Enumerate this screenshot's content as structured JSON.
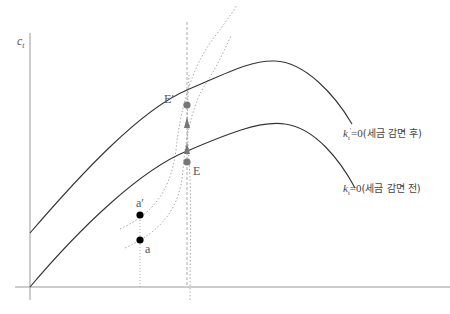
{
  "diagram": {
    "type": "phase-diagram",
    "axes": {
      "y_label": "c",
      "y_label_sub": "t"
    },
    "curves": [
      {
        "id": "kdot-after",
        "label_var": "k",
        "label_sub": "t",
        "label_prime": "'",
        "label_eq": "=0",
        "label_text": "(세금 감면 후)"
      },
      {
        "id": "kdot-before",
        "label_var": "k",
        "label_sub": "t",
        "label_eq": "=0",
        "label_text": "(세금 감면 전)"
      }
    ],
    "points": {
      "E": "E",
      "E_prime": "E′",
      "a": "a",
      "a_prime": "a′"
    },
    "colors": {
      "curve": "#333333",
      "axis": "#999999",
      "dotted": "#aaaaaa",
      "point": "#777777",
      "dark_point": "#000000"
    }
  }
}
